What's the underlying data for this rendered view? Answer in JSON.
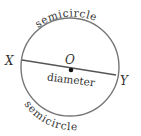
{
  "diagram": {
    "title": "",
    "circle": {
      "cx": 70,
      "cy": 67,
      "r": 49,
      "stroke": "#777777",
      "stroke_width": 1.4
    },
    "diameter_line": {
      "x1": 22,
      "y1": 60,
      "x2": 116,
      "y2": 75,
      "stroke": "#555555",
      "stroke_width": 1.3
    },
    "center_point": {
      "cx": 71,
      "cy": 70,
      "r": 2.3,
      "fill": "#111111"
    },
    "labels": {
      "center": "O",
      "left_endpoint": "X",
      "right_endpoint": "Y",
      "diameter": "diameter",
      "top_arc": "semicircle",
      "bottom_arc": "semicircle"
    },
    "text_color": "#333333"
  }
}
